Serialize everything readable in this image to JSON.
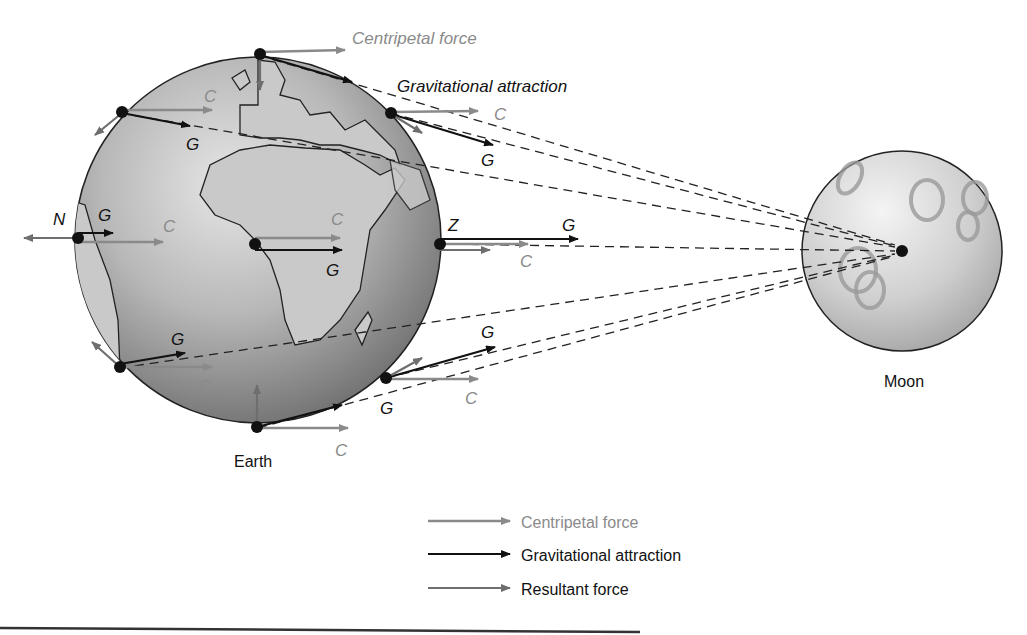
{
  "diagram": {
    "title_labels": {
      "centripetal": "Centripetal force",
      "gravitational": "Gravitational attraction"
    },
    "bodies": {
      "earth": "Earth",
      "moon": "Moon"
    },
    "vector_labels": {
      "C": "C",
      "G": "G",
      "N": "N",
      "Z": "Z"
    },
    "legend": [
      {
        "label": "Centripetal force",
        "color": "#8a8a8a"
      },
      {
        "label": "Gravitational attraction",
        "color": "#111111"
      },
      {
        "label": "Resultant force",
        "color": "#6e6e6e"
      }
    ],
    "colors": {
      "centripetal": "#8a8a8a",
      "gravitational": "#111111",
      "resultant": "#6e6e6e"
    }
  }
}
